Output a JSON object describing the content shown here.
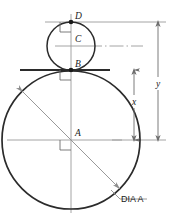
{
  "diagram": {
    "colors": {
      "object_line": "#2b2b2b",
      "construction_line": "#9a9a9a",
      "center_line": "#9a9a9a",
      "dimension_line": "#6e6e6e",
      "leader_line": "#9a9a9a",
      "text": "#1a1a1a",
      "background": "#ffffff"
    },
    "points": [
      {
        "id": "D",
        "label": "D",
        "role": "top-of-small-circle",
        "x": 71,
        "y": 22
      },
      {
        "id": "C",
        "label": "C",
        "role": "center-of-small-circle",
        "x": 71,
        "y": 46
      },
      {
        "id": "B",
        "label": "B",
        "role": "tangent-point-between-circles",
        "x": 71,
        "y": 70
      },
      {
        "id": "A",
        "label": "A",
        "role": "center-of-large-circle",
        "x": 71,
        "y": 140
      }
    ],
    "circles": [
      {
        "id": "small-circle",
        "center_label": "C",
        "cx": 71,
        "cy": 46,
        "r": 24
      },
      {
        "id": "large-circle",
        "center_label": "A",
        "cx": 71,
        "cy": 140,
        "r": 69
      }
    ],
    "dimensions": [
      {
        "id": "x",
        "label": "x",
        "from_point": "B",
        "to_point": "A",
        "orientation": "vertical",
        "label_x": 134,
        "label_y": 101
      },
      {
        "id": "y",
        "label": "y",
        "from_point": "D",
        "to_point": "A",
        "orientation": "vertical",
        "label_x": 158,
        "label_y": 83
      }
    ],
    "leaders": [
      {
        "id": "dia-a-leader",
        "label": "DIA A",
        "describes": "large-circle",
        "label_x": 133,
        "label_y": 199
      }
    ],
    "annotations": {
      "right_angle_marks": 3,
      "tangent_line_at_B": true,
      "diameter_arrow_on_large_circle": true
    }
  }
}
